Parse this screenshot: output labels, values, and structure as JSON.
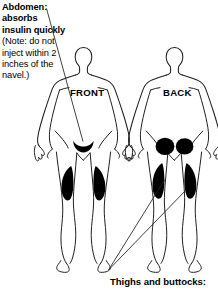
{
  "diagram": {
    "abdomen_callout": {
      "heading": "Abdomen: absorbs insulin quickly",
      "note": "(Note: do not inject within 2 inches of the navel.)"
    },
    "figures": [
      {
        "id": "front",
        "label": "FRONT"
      },
      {
        "id": "back",
        "label": "BACK"
      }
    ],
    "thighs_callout": {
      "label": "Thighs and buttocks:"
    },
    "colors": {
      "outline": "#231f20",
      "site_fill": "#000000",
      "background": "#ffffff",
      "text": "#000000"
    },
    "injection_sites": [
      {
        "name": "abdomen-crescent",
        "figure": "front",
        "shape": "crescent"
      },
      {
        "name": "left-thigh-patch",
        "figure": "front",
        "shape": "teardrop"
      },
      {
        "name": "right-thigh-patch",
        "figure": "front",
        "shape": "teardrop"
      },
      {
        "name": "left-buttock-circle",
        "figure": "back",
        "shape": "ellipse"
      },
      {
        "name": "right-buttock-circle",
        "figure": "back",
        "shape": "ellipse"
      },
      {
        "name": "left-back-thigh-patch",
        "figure": "back",
        "shape": "teardrop"
      },
      {
        "name": "right-back-thigh-patch",
        "figure": "back",
        "shape": "teardrop"
      }
    ]
  }
}
